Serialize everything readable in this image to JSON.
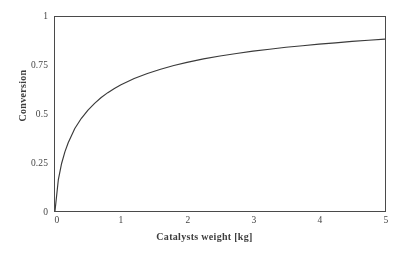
{
  "figure": {
    "background_color": "#ffffff",
    "frame_color": "#4a4a4a",
    "curve_color": "#3a3a3a"
  },
  "chart_data": {
    "type": "line",
    "title": "",
    "xlabel": "Catalysts weight [kg]",
    "ylabel": "Conversion",
    "xlim": [
      0,
      5
    ],
    "ylim": [
      0,
      1
    ],
    "xticks": [
      "0",
      "1",
      "2",
      "3",
      "4",
      "5"
    ],
    "yticks": [
      "0",
      "0.25",
      "0.5",
      "0.75",
      "1"
    ],
    "grid": false,
    "legend": null,
    "series": [
      {
        "name": "Conversion",
        "x": [
          0.0,
          0.05,
          0.1,
          0.15,
          0.2,
          0.3,
          0.4,
          0.5,
          0.6,
          0.7,
          0.8,
          0.9,
          1.0,
          1.2,
          1.4,
          1.6,
          1.8,
          2.0,
          2.25,
          2.5,
          2.75,
          3.0,
          3.25,
          3.5,
          3.75,
          4.0,
          4.25,
          4.5,
          4.75,
          5.0
        ],
        "values": [
          0.0,
          0.16,
          0.245,
          0.305,
          0.352,
          0.425,
          0.478,
          0.52,
          0.555,
          0.585,
          0.61,
          0.632,
          0.651,
          0.683,
          0.709,
          0.731,
          0.75,
          0.766,
          0.784,
          0.799,
          0.812,
          0.824,
          0.834,
          0.844,
          0.852,
          0.86,
          0.867,
          0.874,
          0.88,
          0.886
        ]
      }
    ]
  },
  "axes": {
    "y_ticks": [
      {
        "label": "1",
        "value": 1.0
      },
      {
        "label": "0.75",
        "value": 0.75
      },
      {
        "label": "0.5",
        "value": 0.5
      },
      {
        "label": "0.25",
        "value": 0.25
      },
      {
        "label": "0",
        "value": 0.0
      }
    ],
    "x_ticks": [
      {
        "label": "0",
        "value": 0
      },
      {
        "label": "1",
        "value": 1
      },
      {
        "label": "2",
        "value": 2
      },
      {
        "label": "3",
        "value": 3
      },
      {
        "label": "4",
        "value": 4
      },
      {
        "label": "5",
        "value": 5
      }
    ]
  }
}
